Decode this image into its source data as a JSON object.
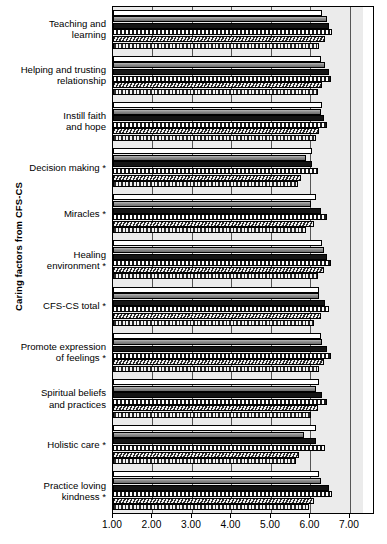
{
  "chart_data": {
    "type": "bar",
    "orientation": "horizontal",
    "title": "",
    "xlabel": "",
    "ylabel": "Caring factors from CFS-CS",
    "xlim": [
      1.0,
      7.33
    ],
    "xticks": [
      "1.00",
      "2.00",
      "3.00",
      "4.00",
      "5.00",
      "6.00",
      "7.00"
    ],
    "xtick_values": [
      1,
      2,
      3,
      4,
      5,
      6,
      7
    ],
    "grid": true,
    "legend": "none",
    "categories": [
      "Teaching and\nlearning",
      "Helping and trusting\nrelationship",
      "Instill faith\nand hope",
      "Decision making *",
      "Miracles *",
      "Healing\nenvironment *",
      "CFS-CS total *",
      "Promote expression\nof feelings *",
      "Spiritual beliefs\nand practices",
      "Holistic care *",
      "Practice loving\nkindness *"
    ],
    "series": [
      {
        "name": "series-1",
        "pattern": "white",
        "values": [
          6.3,
          6.26,
          6.3,
          6.05,
          6.13,
          6.3,
          6.22,
          6.26,
          6.22,
          6.13,
          6.22
        ]
      },
      {
        "name": "series-2",
        "pattern": "gray-gradient",
        "values": [
          6.42,
          6.38,
          6.26,
          5.88,
          6.01,
          6.34,
          6.22,
          6.3,
          6.13,
          5.84,
          6.26
        ]
      },
      {
        "name": "series-3",
        "pattern": "black",
        "values": [
          6.46,
          6.46,
          6.34,
          6.05,
          6.26,
          6.42,
          6.38,
          6.42,
          6.3,
          6.13,
          6.46
        ]
      },
      {
        "name": "series-4",
        "pattern": "checker",
        "values": [
          6.55,
          6.51,
          6.42,
          6.18,
          6.42,
          6.51,
          6.46,
          6.51,
          6.42,
          6.38,
          6.55
        ]
      },
      {
        "name": "series-5",
        "pattern": "diagonal-hatch",
        "values": [
          6.38,
          6.3,
          6.22,
          5.76,
          6.09,
          6.34,
          6.26,
          6.34,
          6.18,
          5.72,
          6.09
        ]
      },
      {
        "name": "series-6",
        "pattern": "dotted",
        "values": [
          6.22,
          6.18,
          6.13,
          5.68,
          5.88,
          6.18,
          6.09,
          6.22,
          6.01,
          5.64,
          5.97
        ]
      }
    ]
  },
  "colors": {
    "plot_background": "#ebebeb",
    "axis": "#000000",
    "gridline": "#555555"
  }
}
